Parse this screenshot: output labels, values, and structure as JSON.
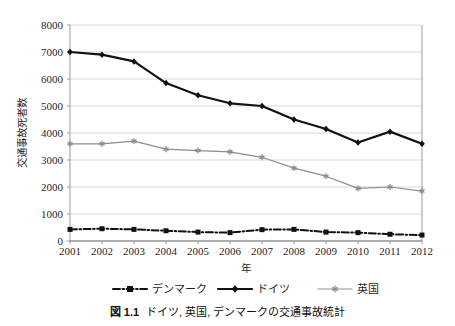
{
  "figure": {
    "caption_number": "図 1.1",
    "caption_text": "ドイツ, 英国, デンマークの交通事故統計"
  },
  "chart_data": {
    "type": "line",
    "title": "",
    "xlabel": "年",
    "ylabel": "交通事故死者数",
    "x": [
      2001,
      2002,
      2003,
      2004,
      2005,
      2006,
      2007,
      2008,
      2009,
      2010,
      2011,
      2012
    ],
    "categories": [
      "2001",
      "2002",
      "2003",
      "2004",
      "2005",
      "2006",
      "2007",
      "2008",
      "2009",
      "2010",
      "2011",
      "2012"
    ],
    "ylim": [
      0,
      8000
    ],
    "yticks": [
      0,
      1000,
      2000,
      3000,
      4000,
      5000,
      6000,
      7000,
      8000
    ],
    "yticklabels": [
      "0",
      "1000",
      "2000",
      "3000",
      "4000",
      "5000",
      "6000",
      "7000",
      "8000"
    ],
    "grid": true,
    "legend_position": "below",
    "series": [
      {
        "name": "デンマーク",
        "color": "#111111",
        "linestyle": "dashdot",
        "marker": "square",
        "values": [
          430,
          455,
          430,
          380,
          330,
          310,
          420,
          430,
          330,
          310,
          250,
          220
        ]
      },
      {
        "name": "ドイツ",
        "color": "#111111",
        "linestyle": "solid",
        "marker": "diamond",
        "values": [
          7000,
          6900,
          6650,
          5850,
          5400,
          5100,
          5000,
          4500,
          4150,
          3650,
          4050,
          3600
        ]
      },
      {
        "name": "英国",
        "color": "#8c8c8c",
        "linestyle": "solid",
        "marker": "asterisk",
        "values": [
          3600,
          3600,
          3700,
          3400,
          3350,
          3300,
          3100,
          2700,
          2400,
          1950,
          2000,
          1850
        ]
      }
    ]
  },
  "legend": {
    "items": [
      {
        "label": "デンマーク"
      },
      {
        "label": "ドイツ"
      },
      {
        "label": "英国"
      }
    ]
  }
}
